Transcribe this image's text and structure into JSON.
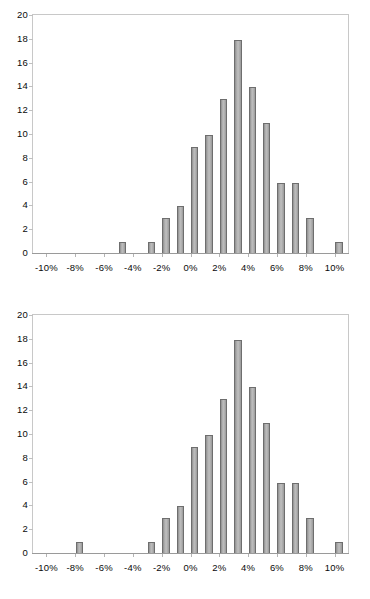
{
  "document": {
    "background_color": "#ffffff",
    "figure_count": 2
  },
  "style": {
    "bar_fill": "#b0b0b0",
    "bar_border": "#6e6e6e",
    "axis_color": "#9a9a9a",
    "plot_border": "#c8c8c8",
    "text_color": "#0a0a0a"
  },
  "chart_data": [
    {
      "id": "histogram-top",
      "type": "bar",
      "title": "",
      "subtitle": "",
      "xlabel": "",
      "ylabel": "",
      "grid": false,
      "legend": false,
      "legend_position": "none",
      "xlim": [
        -11,
        11
      ],
      "ylim": [
        0,
        20
      ],
      "ytick_step": 2,
      "xtick_step": 2,
      "ytick_labels": [
        "0",
        "2",
        "4",
        "6",
        "8",
        "10",
        "12",
        "14",
        "16",
        "18",
        "20"
      ],
      "ytick_values": [
        0,
        2,
        4,
        6,
        8,
        10,
        12,
        14,
        16,
        18,
        20
      ],
      "xtick_labels": [
        "-10%",
        "-8%",
        "-6%",
        "-4%",
        "-2%",
        "0%",
        "2%",
        "4%",
        "6%",
        "8%",
        "10%"
      ],
      "xtick_values": [
        -10,
        -8,
        -6,
        -4,
        -2,
        0,
        2,
        4,
        6,
        8,
        10
      ],
      "categories": [
        "-10%",
        "-9%",
        "-8%",
        "-7%",
        "-6%",
        "-5%",
        "-4%",
        "-3%",
        "-2%",
        "-1%",
        "0%",
        "1%",
        "2%",
        "3%",
        "4%",
        "5%",
        "6%",
        "7%",
        "8%",
        "9%",
        "10%"
      ],
      "x": [
        -10,
        -9,
        -8,
        -7,
        -6,
        -5,
        -4,
        -3,
        -2,
        -1,
        0,
        1,
        2,
        3,
        4,
        5,
        6,
        7,
        8,
        9,
        10
      ],
      "values": [
        0,
        0,
        0,
        1,
        0,
        1,
        3,
        4,
        9,
        10,
        13,
        18,
        14,
        11,
        6,
        6,
        3,
        0,
        1,
        0,
        0
      ]
    },
    {
      "id": "histogram-bottom",
      "type": "bar",
      "title": "",
      "subtitle": "",
      "xlabel": "",
      "ylabel": "",
      "grid": false,
      "legend": false,
      "legend_position": "none",
      "xlim": [
        -11,
        11
      ],
      "ylim": [
        0,
        20
      ],
      "ytick_step": 2,
      "xtick_step": 2,
      "ytick_labels": [
        "0",
        "2",
        "4",
        "6",
        "8",
        "10",
        "12",
        "14",
        "16",
        "18",
        "20"
      ],
      "ytick_values": [
        0,
        2,
        4,
        6,
        8,
        10,
        12,
        14,
        16,
        18,
        20
      ],
      "xtick_labels": [
        "-10%",
        "-8%",
        "-6%",
        "-4%",
        "-2%",
        "0%",
        "2%",
        "4%",
        "6%",
        "8%",
        "10%"
      ],
      "xtick_values": [
        -10,
        -8,
        -6,
        -4,
        -2,
        0,
        2,
        4,
        6,
        8,
        10
      ],
      "categories": [
        "-10%",
        "-9%",
        "-8%",
        "-7%",
        "-6%",
        "-5%",
        "-4%",
        "-3%",
        "-2%",
        "-1%",
        "0%",
        "1%",
        "2%",
        "3%",
        "4%",
        "5%",
        "6%",
        "7%",
        "8%",
        "9%",
        "10%"
      ],
      "x": [
        -10,
        -9,
        -8,
        -7,
        -6,
        -5,
        -4,
        -3,
        -2,
        -1,
        0,
        1,
        2,
        3,
        4,
        5,
        6,
        7,
        8,
        9,
        10
      ],
      "values": [
        1,
        0,
        0,
        0,
        0,
        1,
        3,
        4,
        9,
        10,
        13,
        18,
        14,
        11,
        6,
        6,
        3,
        0,
        1,
        0,
        0
      ]
    }
  ]
}
